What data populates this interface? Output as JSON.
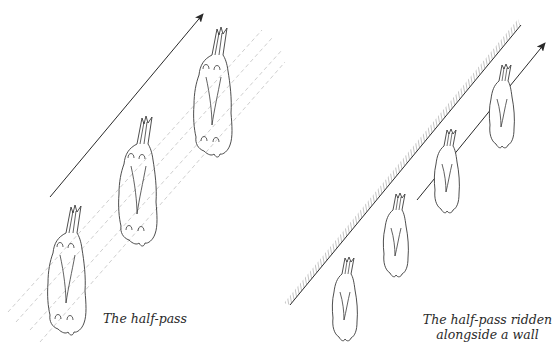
{
  "figures": {
    "left": {
      "caption": "The half-pass",
      "horse_count": 3,
      "direction_arrow": "arrow-up-right",
      "track_lines": "dashed-diagonal-tracks"
    },
    "right": {
      "caption_line1": "The half-pass ridden",
      "caption_line2": "alongside a wall",
      "horse_count": 4,
      "direction_arrow": "arrow-up-right",
      "wall": "hatched-diagonal-wall"
    }
  },
  "colors": {
    "ink": "#3a3a3a",
    "dashed": "#c8c8c8",
    "background": "#ffffff"
  }
}
